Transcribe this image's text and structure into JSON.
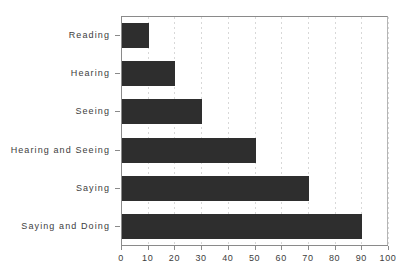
{
  "chart_data": {
    "type": "bar",
    "orientation": "horizontal",
    "title": "",
    "subtitle": "",
    "xlabel": "",
    "ylabel": "",
    "categories": [
      "Reading",
      "Hearing",
      "Seeing",
      "Hearing and Seeing",
      "Saying",
      "Saying and Doing"
    ],
    "values": [
      10,
      20,
      30,
      50,
      70,
      90
    ],
    "xlim": [
      0,
      100
    ],
    "xticks": [
      0,
      10,
      20,
      30,
      40,
      50,
      60,
      70,
      80,
      90,
      100
    ],
    "xtick_labels": [
      "0",
      "10",
      "20",
      "30",
      "40",
      "50",
      "60",
      "70",
      "80",
      "90",
      "100"
    ],
    "grid": true,
    "grid_axis": "x",
    "legend": false,
    "legend_position": "none",
    "bar_color": "#2e2e2e",
    "grid_color": "#d8d8d8",
    "axis_color": "#8a8a8a",
    "background_color": "#ffffff"
  }
}
